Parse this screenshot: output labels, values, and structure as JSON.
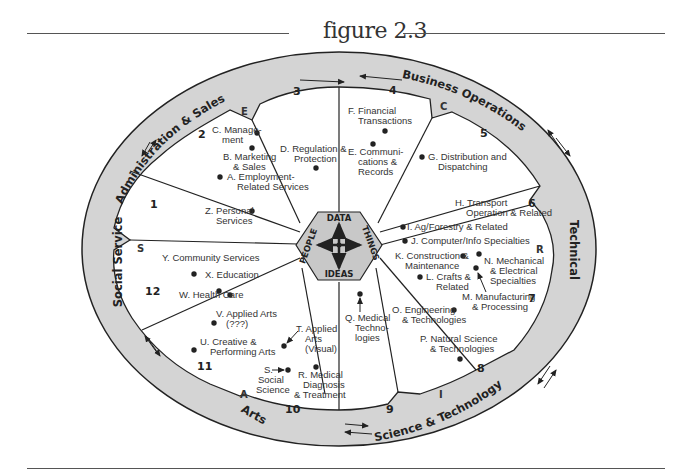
{
  "figure": {
    "title": "figure 2.3"
  },
  "ring": {
    "groups": [
      {
        "label": "Administration & Sales",
        "letter": "E"
      },
      {
        "label": "Business Operations",
        "letter": "C"
      },
      {
        "label": "Technical",
        "letter": "R"
      },
      {
        "label": "Science & Technology",
        "letter": "I"
      },
      {
        "label": "Arts",
        "letter": "A"
      },
      {
        "label": "Social Service",
        "letter": "S"
      }
    ]
  },
  "hub": {
    "top": "DATA",
    "right": "THINGS",
    "bottom": "IDEAS",
    "left": "PEOPLE"
  },
  "regions": [
    "1",
    "2",
    "3",
    "4",
    "5",
    "6",
    "7",
    "8",
    "9",
    "10",
    "11",
    "12"
  ],
  "job_families": {
    "A": {
      "label1": "A. Employment-",
      "label2": "Related Services"
    },
    "B": {
      "label1": "B. Marketing",
      "label2": "& Sales"
    },
    "C": {
      "label1": "C. Manage-",
      "label2": "ment"
    },
    "D": {
      "label1": "D. Regulation &",
      "label2": "Protection"
    },
    "E": {
      "label1": "E. Communi-",
      "label2": "cations &",
      "label3": "Records"
    },
    "F": {
      "label1": "F. Financial",
      "label2": "Transactions"
    },
    "G": {
      "label1": "G. Distribution and",
      "label2": "Dispatching"
    },
    "H": {
      "label1": "H. Transport",
      "label2": "Operation & Related"
    },
    "I": {
      "label1": "I.  Ag/Forestry & Related"
    },
    "J": {
      "label1": "J. Computer/Info Specialties"
    },
    "K": {
      "label1": "K. Construction &",
      "label2": "Maintenance"
    },
    "L": {
      "label1": "L.  Crafts &",
      "label2": "Related"
    },
    "M": {
      "label1": "M. Manufacturing",
      "label2": "& Processing"
    },
    "N": {
      "label1": "N. Mechanical",
      "label2": "& Electrical",
      "label3": "Specialties"
    },
    "O": {
      "label1": "O. Engineering",
      "label2": "& Technologies"
    },
    "P": {
      "label1": "P. Natural Science",
      "label2": "& Technologies"
    },
    "Q": {
      "label1": "Q. Medical",
      "label2": "Techno-",
      "label3": "logies"
    },
    "R": {
      "label1": "R. Medical",
      "label2": "Diagnosis",
      "label3": "& Treatment"
    },
    "S": {
      "label1": "S.",
      "label2": "Social",
      "label3": "Science"
    },
    "T": {
      "label1": "T. Applied",
      "label2": "Arts",
      "label3": "(Visual)"
    },
    "U": {
      "label1": "U. Creative &",
      "label2": "Performing Arts"
    },
    "V": {
      "label1": "V. Applied Arts",
      "label2": "(???)"
    },
    "W": {
      "label1": "W. Health Care"
    },
    "X": {
      "label1": "X. Education"
    },
    "Y": {
      "label1": "Y. Community Services"
    },
    "Z": {
      "label1": "Z. Personal",
      "label2": "Services"
    }
  },
  "colors": {
    "ring_fill": "#d4d4d4",
    "hub_fill": "#c8c8c8",
    "line": "#222222",
    "text": "#333333"
  }
}
